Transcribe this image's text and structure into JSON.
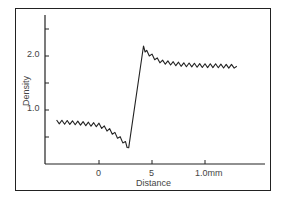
{
  "chart_data": {
    "type": "line",
    "title": "",
    "xlabel": "Distance",
    "ylabel": "Density",
    "x_ticks": [
      {
        "value": 0,
        "label": "0"
      },
      {
        "value": 5,
        "label": "5"
      },
      {
        "value": 10,
        "label": "1.0mm"
      }
    ],
    "y_ticks": [
      {
        "value": 0.5,
        "label": ""
      },
      {
        "value": 1.0,
        "label": "1.0"
      },
      {
        "value": 1.5,
        "label": ""
      },
      {
        "value": 2.0,
        "label": "2.0"
      },
      {
        "value": 2.5,
        "label": ""
      }
    ],
    "xlim": [
      -5,
      15.5
    ],
    "ylim": [
      0,
      2.8
    ],
    "grid": false,
    "legend": null,
    "series": [
      {
        "name": "Density profile",
        "x": [
          -4.0,
          -3.0,
          -2.0,
          -1.0,
          0.0,
          0.5,
          1.0,
          1.5,
          2.0,
          2.5,
          2.8,
          4.2,
          4.5,
          5.0,
          5.5,
          6.0,
          7.0,
          8.0,
          9.0,
          10.0,
          11.0,
          12.0,
          13.0
        ],
        "values": [
          0.78,
          0.77,
          0.76,
          0.74,
          0.72,
          0.67,
          0.62,
          0.55,
          0.47,
          0.38,
          0.3,
          2.15,
          2.07,
          2.0,
          1.93,
          1.89,
          1.86,
          1.84,
          1.83,
          1.82,
          1.82,
          1.81,
          1.81
        ]
      }
    ]
  },
  "labels": {
    "xlabel": "Distance",
    "ylabel": "Density",
    "x_tick_0": "0",
    "x_tick_5": "5",
    "x_tick_10": "1.0mm",
    "y_tick_1": "1.0",
    "y_tick_2": "2.0"
  }
}
